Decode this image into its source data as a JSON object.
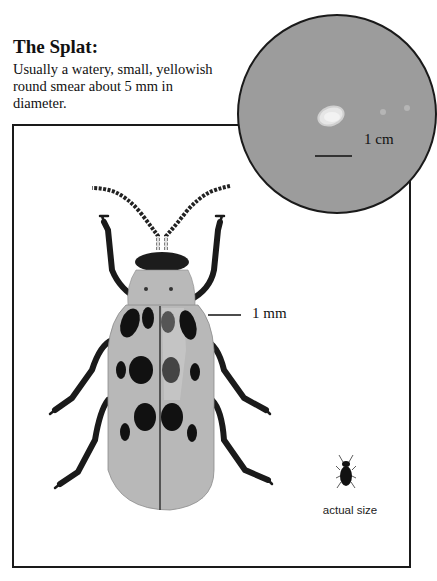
{
  "heading": "The Splat:",
  "description": "Usually a watery, small, yellowish round smear about 5 mm in diameter.",
  "magnified_view": {
    "scale_label": "1 cm",
    "background_color": "#9c9c9c",
    "splat_color": "#e8e8e8"
  },
  "beetle_illustration": {
    "scale_label": "1 mm",
    "elytra_color": "#b8b8b8",
    "spot_color": "#111111",
    "spot_count": 12
  },
  "actual_size": {
    "label": "actual size"
  }
}
